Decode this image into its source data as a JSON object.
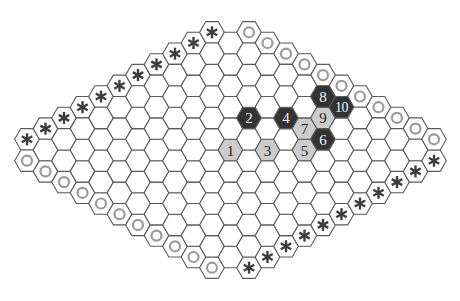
{
  "game": {
    "name": "Hex",
    "board_size": 11,
    "orientation": "flat-top hexes, rhombus board",
    "edge_markers": {
      "top_left": "asterisk",
      "bottom_right": "asterisk",
      "top_right": "circle",
      "bottom_left": "circle"
    },
    "edge_marker_icons": {
      "asterisk": "asterisk-icon",
      "circle": "ring-icon"
    }
  },
  "colors": {
    "background": "#ffffff",
    "grid_line": "#5a5a5a",
    "empty_cell": "#ffffff",
    "light_stone": "#cccccc",
    "dark_stone": "#333333",
    "light_stone_text": "#222222",
    "dark_stone_text": "#f2f2f2",
    "asterisk": "#3d3d3d",
    "circle": "#9a9a9a"
  },
  "pieces": [
    {
      "move": "1",
      "color": "light",
      "i": 6,
      "j": 6
    },
    {
      "move": "2",
      "color": "dark",
      "i": 8,
      "j": 5
    },
    {
      "move": "3",
      "color": "light",
      "i": 7,
      "j": 7
    },
    {
      "move": "4",
      "color": "dark",
      "i": 9,
      "j": 6
    },
    {
      "move": "5",
      "color": "light",
      "i": 8,
      "j": 8
    },
    {
      "move": "6",
      "color": "dark",
      "i": 9,
      "j": 8
    },
    {
      "move": "7",
      "color": "light",
      "i": 9,
      "j": 7
    },
    {
      "move": "8",
      "color": "dark",
      "i": 11,
      "j": 6
    },
    {
      "move": "9",
      "color": "light",
      "i": 10,
      "j": 7
    },
    {
      "move": "10",
      "color": "dark",
      "i": 11,
      "j": 7
    }
  ]
}
